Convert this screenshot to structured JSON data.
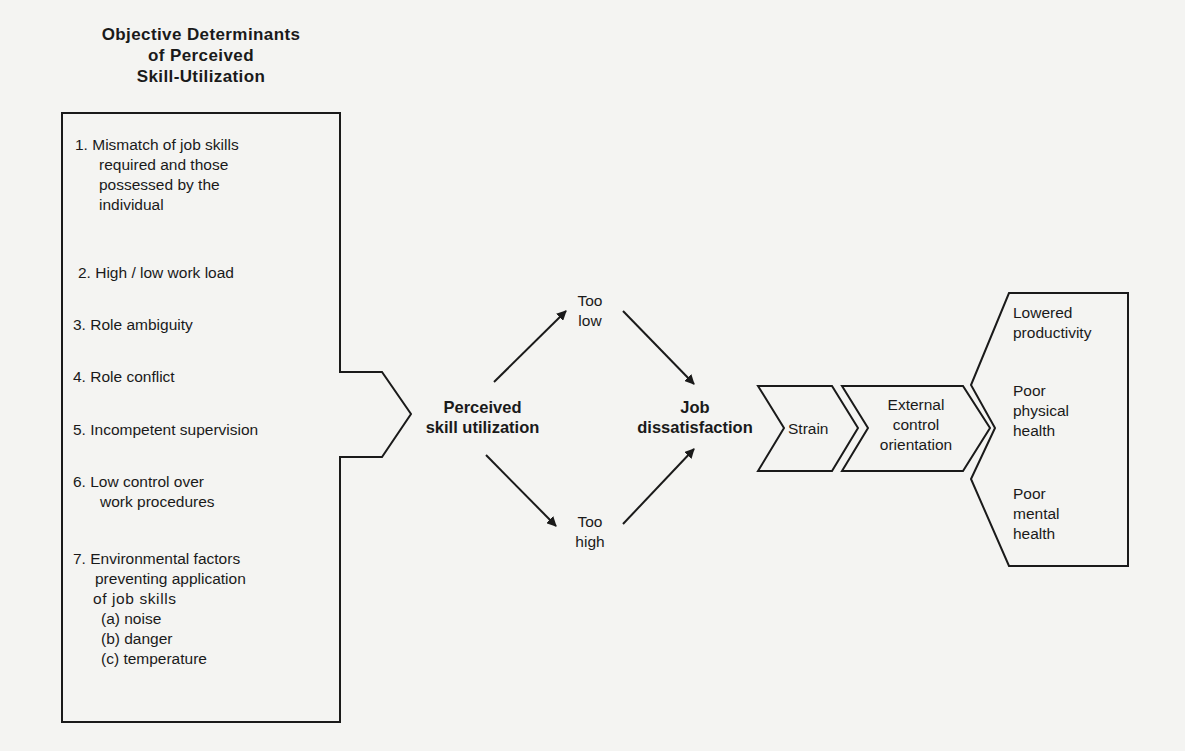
{
  "title": {
    "line1": "Objective Determinants",
    "line2": "of Perceived",
    "line3": "Skill-Utilization"
  },
  "determinants": {
    "item1": {
      "l1": "1. Mismatch of job skills",
      "l2": "required and those",
      "l3": "possessed by the",
      "l4": "individual"
    },
    "item2": "2. High / low work load",
    "item3": "3. Role ambiguity",
    "item4": "4. Role conflict",
    "item5": "5. Incompetent supervision",
    "item6": {
      "l1": "6.  Low control over",
      "l2": "work procedures"
    },
    "item7": {
      "l1": "7. Environmental factors",
      "l2": "preventing application",
      "l3": "of job skills",
      "a": "(a) noise",
      "b": "(b) danger",
      "c": "(c) temperature"
    }
  },
  "nodes": {
    "perceived": {
      "l1": "Perceived",
      "l2": "skill utilization"
    },
    "too_low": {
      "l1": "Too",
      "l2": "low"
    },
    "too_high": {
      "l1": "Too",
      "l2": "high"
    },
    "job": {
      "l1": "Job",
      "l2": "dissatisfaction"
    },
    "strain": "Strain",
    "external": {
      "l1": "External",
      "l2": "control",
      "l3": "orientation"
    }
  },
  "outcomes": {
    "o1": {
      "l1": "Lowered",
      "l2": "productivity"
    },
    "o2": {
      "l1": "Poor",
      "l2": "physical",
      "l3": "health"
    },
    "o3": {
      "l1": "Poor",
      "l2": "mental",
      "l3": "health"
    }
  },
  "colors": {
    "line": "#1a1a1a",
    "background": "#f4f4f2"
  }
}
